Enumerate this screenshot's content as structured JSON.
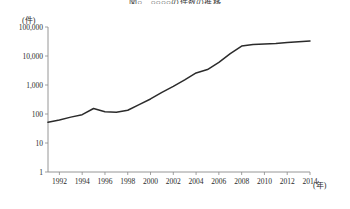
{
  "chart_data": {
    "type": "line",
    "title": "図○　○○○○の件数の推移",
    "xlabel": "(年)",
    "ylabel": "(件)",
    "yscale": "log",
    "ylim": [
      1,
      100000
    ],
    "xlim": [
      1991,
      2014
    ],
    "grid": false,
    "legend": null,
    "y_tick_labels": [
      "100,000",
      "10,000",
      "1,000",
      "100",
      "10",
      "1"
    ],
    "y_tick_values": [
      100000,
      10000,
      1000,
      100,
      10,
      1
    ],
    "x_tick_labels": [
      "1992",
      "1994",
      "1996",
      "1998",
      "2000",
      "2002",
      "2004",
      "2006",
      "2008",
      "2010",
      "2012",
      "2014"
    ],
    "x_tick_values": [
      1992,
      1994,
      1996,
      1998,
      2000,
      2002,
      2004,
      2006,
      2008,
      2010,
      2012,
      2014
    ],
    "x": [
      1991,
      1992,
      1993,
      1994,
      1995,
      1996,
      1997,
      1998,
      1999,
      2000,
      2001,
      2002,
      2003,
      2004,
      2005,
      2006,
      2007,
      2008,
      2009,
      2010,
      2011,
      2012,
      2013,
      2014
    ],
    "values": [
      52,
      62,
      78,
      95,
      155,
      120,
      115,
      135,
      210,
      330,
      560,
      900,
      1500,
      2600,
      3400,
      6000,
      12000,
      22000,
      25000,
      26000,
      27000,
      29000,
      31000,
      33000
    ],
    "series": [
      {
        "name": "件数",
        "values": [
          52,
          62,
          78,
          95,
          155,
          120,
          115,
          135,
          210,
          330,
          560,
          900,
          1500,
          2600,
          3400,
          6000,
          12000,
          22000,
          25000,
          26000,
          27000,
          29000,
          31000,
          33000
        ]
      }
    ],
    "line_color": "#2b2b2b",
    "axis_color": "#8a8a8a"
  },
  "axis": {
    "y_unit": "(件)",
    "x_unit": "(年)"
  }
}
